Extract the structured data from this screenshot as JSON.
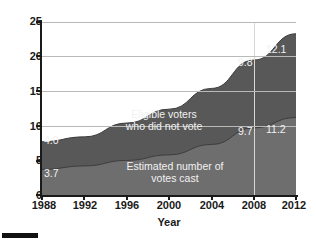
{
  "chart_data": {
    "type": "area",
    "stacked": true,
    "title": "",
    "subtitle": "",
    "xlabel": "Year",
    "ylabel": "",
    "x": [
      1988,
      1992,
      1996,
      2000,
      2004,
      2008,
      2012
    ],
    "xtick_labels": [
      "1988",
      "1992",
      "1996",
      "2000",
      "2004",
      "2008",
      "2012"
    ],
    "ytick_labels": [
      "0",
      "5",
      "10",
      "15",
      "20",
      "25"
    ],
    "ytick_values": [
      0,
      5,
      10,
      15,
      20,
      25
    ],
    "ylim": [
      0,
      25
    ],
    "xlim": [
      1988,
      2012
    ],
    "grid": true,
    "gridlines_at": [
      10,
      15,
      20,
      25
    ],
    "legend_position": "inside-plot-labels",
    "series": [
      {
        "name": "Estimated number of votes cast",
        "values": [
          3.7,
          4.2,
          5.0,
          5.8,
          7.3,
          9.7,
          11.2
        ],
        "fill_color": "#6e6e6e",
        "labeled_points": [
          {
            "x": 1988,
            "value": 3.7,
            "label": "3.7"
          },
          {
            "x": 2008,
            "value": 9.7,
            "label": "9.7"
          },
          {
            "x": 2012,
            "value": 11.2,
            "label": "11.2"
          }
        ]
      },
      {
        "name": "Eligible voters who did not vote",
        "values": [
          4.0,
          4.2,
          5.4,
          6.6,
          8.1,
          9.8,
          12.1
        ],
        "fill_color": "#585858",
        "labeled_points": [
          {
            "x": 1988,
            "value": 4.0,
            "label": "4.0"
          },
          {
            "x": 2008,
            "value": 9.8,
            "label": "9.8"
          },
          {
            "x": 2012,
            "value": 12.1,
            "label": "12.1"
          }
        ]
      }
    ],
    "stack_totals": [
      7.7,
      8.4,
      10.4,
      12.4,
      15.4,
      19.5,
      23.3
    ],
    "annotations": [
      {
        "name": "upper-band-label",
        "text": "Eligible voters\nwho did not vote"
      },
      {
        "name": "lower-band-label",
        "text": "Estimated number of\nvotes cast"
      }
    ],
    "marker_lines": [
      {
        "x": 2008,
        "color": "#d7d7d7"
      }
    ],
    "colors": {
      "upper_band": "#585858",
      "lower_band": "#6e6e6e",
      "gridline": "#b9b9b9",
      "axis": "#1a1a1a",
      "label_text": "#f2f2f2",
      "background": "#ffffff"
    }
  },
  "axes": {
    "x_title": "Year",
    "y_ticks": [
      {
        "label": "25",
        "value": 25
      },
      {
        "label": "20",
        "value": 20
      },
      {
        "label": "15",
        "value": 15
      },
      {
        "label": "10",
        "value": 10
      },
      {
        "label": "5",
        "value": 5
      },
      {
        "label": "0",
        "value": 0
      }
    ],
    "x_ticks": [
      {
        "label": "1988",
        "value": 1988
      },
      {
        "label": "1992",
        "value": 1992
      },
      {
        "label": "1996",
        "value": 1996
      },
      {
        "label": "2000",
        "value": 2000
      },
      {
        "label": "2004",
        "value": 2004
      },
      {
        "label": "2008",
        "value": 2008
      },
      {
        "label": "2012",
        "value": 2012
      }
    ]
  },
  "band_labels": {
    "upper_line1": "Eligible voters",
    "upper_line2": "who did not vote",
    "lower_line1": "Estimated number of",
    "lower_line2": "votes cast"
  },
  "value_labels": {
    "cast_1988": "3.7",
    "nonvote_1988": "4.0",
    "cast_2008": "9.7",
    "nonvote_2008": "9.8",
    "cast_2012": "11.2",
    "nonvote_2012": "12.1"
  }
}
